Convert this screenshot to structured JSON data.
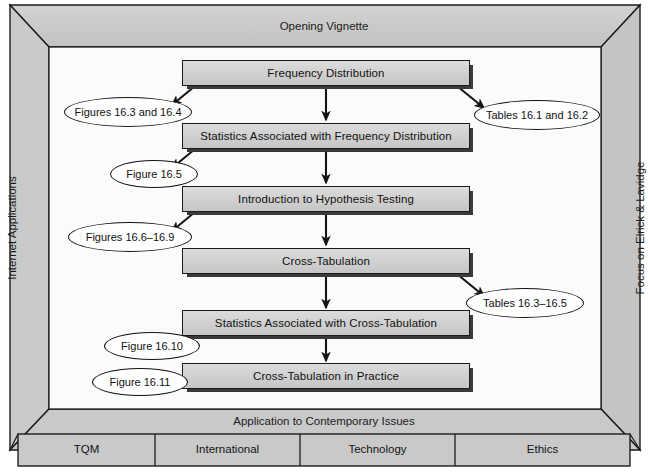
{
  "figure": {
    "title_top": "Opening Vignette",
    "left_panel": "Internet Applications",
    "right_panel": "Focus on Elrick & Lavidge",
    "bottom_band": "Application to Contemporary Issues"
  },
  "flow": {
    "steps": [
      {
        "id": "frequency-distribution",
        "label": "Frequency Distribution"
      },
      {
        "id": "statistics-frequency-distribution",
        "label": "Statistics Associated with Frequency Distribution"
      },
      {
        "id": "introduction-hypothesis-testing",
        "label": "Introduction to Hypothesis Testing"
      },
      {
        "id": "cross-tabulation",
        "label": "Cross-Tabulation"
      },
      {
        "id": "statistics-cross-tabulation",
        "label": "Statistics Associated with Cross-Tabulation"
      },
      {
        "id": "cross-tabulation-in-practice",
        "label": "Cross-Tabulation in Practice"
      }
    ]
  },
  "callouts": {
    "items": [
      {
        "id": "figures-16-3-16-4",
        "label": "Figures 16.3 and 16.4",
        "side": "left"
      },
      {
        "id": "tables-16-1-16-2",
        "label": "Tables 16.1 and 16.2",
        "side": "right"
      },
      {
        "id": "figure-16-5",
        "label": "Figure 16.5",
        "side": "left"
      },
      {
        "id": "figures-16-6-16-9",
        "label": "Figures 16.6–16.9",
        "side": "left"
      },
      {
        "id": "tables-16-3-16-5",
        "label": "Tables 16.3–16.5",
        "side": "right"
      },
      {
        "id": "figure-16-10",
        "label": "Figure 16.10",
        "side": "left"
      },
      {
        "id": "figure-16-11",
        "label": "Figure 16.11",
        "side": "left"
      }
    ]
  },
  "bottom_cells": {
    "items": [
      {
        "id": "tqm",
        "label": "TQM"
      },
      {
        "id": "international",
        "label": "International"
      },
      {
        "id": "technology",
        "label": "Technology"
      },
      {
        "id": "ethics",
        "label": "Ethics"
      }
    ]
  },
  "colors": {
    "frame_fill": "#c9c9c9",
    "box_fill": "#d2d2d2",
    "ink": "#141414",
    "canvas": "#fbfbfb",
    "shadow": "#3a3a3a"
  }
}
